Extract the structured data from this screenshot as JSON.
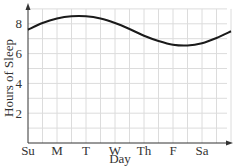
{
  "chart_data": {
    "type": "line",
    "title": "",
    "xlabel": "Day",
    "ylabel": "Hours of Sleep",
    "x_tick_labels": [
      "Su",
      "M",
      "T",
      "W",
      "Th",
      "F",
      "Sa"
    ],
    "y_tick_labels": [
      "2",
      "4",
      "6",
      "8"
    ],
    "xlim": [
      0,
      7
    ],
    "ylim": [
      0,
      9
    ],
    "grid": true,
    "legend": null,
    "series": [
      {
        "name": "Hours of Sleep",
        "x": [
          0,
          0.5,
          1,
          1.5,
          2,
          2.5,
          3,
          3.5,
          4,
          4.5,
          5,
          5.5,
          6,
          6.5,
          7
        ],
        "values": [
          7.6,
          8.05,
          8.35,
          8.5,
          8.5,
          8.35,
          8.05,
          7.65,
          7.2,
          6.85,
          6.6,
          6.55,
          6.7,
          7.05,
          7.5
        ]
      }
    ],
    "colors": {
      "line": "#1a1a1a",
      "grid": "#dcdcdc",
      "axis": "#333333"
    }
  }
}
